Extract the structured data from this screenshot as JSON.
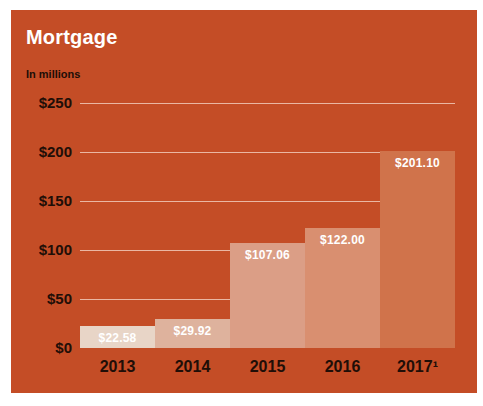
{
  "chart": {
    "title": "Mortgage",
    "subtitle": "In millions"
  },
  "chart_data": {
    "type": "bar",
    "title": "Mortgage",
    "subtitle": "In millions",
    "categories": [
      "2013",
      "2014",
      "2015",
      "2016",
      "2017¹"
    ],
    "values": [
      22.58,
      29.92,
      107.06,
      122.0,
      201.1
    ],
    "value_labels": [
      "$22.58",
      "$29.92",
      "$107.06",
      "$122.00",
      "$201.10"
    ],
    "xlabel": "",
    "ylabel": "In millions",
    "ylim": [
      0,
      250
    ],
    "y_ticks": [
      {
        "value": 0,
        "label": "$0"
      },
      {
        "value": 50,
        "label": "$50"
      },
      {
        "value": 100,
        "label": "$100"
      },
      {
        "value": 150,
        "label": "$150"
      },
      {
        "value": 200,
        "label": "$200"
      },
      {
        "value": 250,
        "label": "$250"
      }
    ],
    "grid": true,
    "legend": false,
    "colors": {
      "page_bg": "#FFFFFF",
      "panel_bg": "#C44D26",
      "title_text": "#FFFFFF",
      "axis_text": "#200E07",
      "value_label_text": "#FFFFFF",
      "gridline": "rgba(255,240,230,0.65)",
      "bars": [
        "#E8D5C7",
        "#DEB29D",
        "#DB9E86",
        "#D98F70",
        "#D0734B"
      ]
    }
  }
}
